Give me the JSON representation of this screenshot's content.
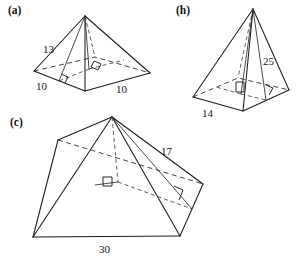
{
  "figure": {
    "background_color": "#ffffff",
    "line_color": "#1b1b1b",
    "parts": [
      {
        "id": "a",
        "label": "(a)",
        "shape": "square-pyramid",
        "measurements": [
          {
            "name": "slant-height",
            "value": "13"
          },
          {
            "name": "base-edge-left",
            "value": "10"
          },
          {
            "name": "base-edge-right",
            "value": "10"
          }
        ],
        "right_angle_marks": 2
      },
      {
        "id": "b",
        "label": "(h)",
        "shape": "square-pyramid",
        "measurements": [
          {
            "name": "slant-height",
            "value": "25"
          },
          {
            "name": "base-edge",
            "value": "14"
          }
        ],
        "right_angle_marks": 2
      },
      {
        "id": "c",
        "label": "(c)",
        "shape": "square-pyramid",
        "measurements": [
          {
            "name": "slant-height",
            "value": "17"
          },
          {
            "name": "base-edge",
            "value": "30"
          }
        ],
        "right_angle_marks": 2
      }
    ]
  },
  "labels": {
    "part_a": "(a)",
    "part_b": "(h)",
    "part_c": "(c)",
    "a_slant": "13",
    "a_base_left": "10",
    "a_base_right": "10",
    "b_slant": "25",
    "b_base": "14",
    "c_slant": "17",
    "c_base": "30"
  }
}
